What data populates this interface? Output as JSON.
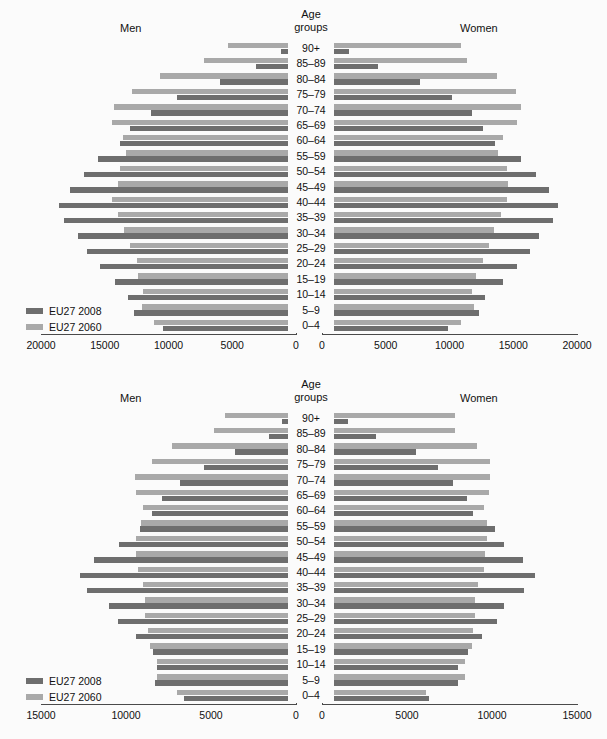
{
  "headers": {
    "men": "Men",
    "women": "Women",
    "age_line1": "Age",
    "age_line2": "groups"
  },
  "legend": {
    "series1": "EU27 2008",
    "series2": "EU27 2060",
    "color1": "#6e6e6e",
    "color2": "#a9a9a9"
  },
  "chart_data": [
    {
      "type": "bar",
      "title": "EU27 population pyramid 2008 vs 2060 (absolute, thousands)",
      "orientation": "horizontal-diverging",
      "xlabel": "",
      "ylabel": "Age groups",
      "xlim": [
        -20000,
        20000
      ],
      "grid": false,
      "legend_position": "bottom-left",
      "left_label": "Men",
      "right_label": "Women",
      "xticks_left": [
        "20000",
        "15000",
        "10000",
        "5000",
        "0"
      ],
      "xticks_right": [
        "0",
        "5000",
        "10000",
        "15000",
        "20000"
      ],
      "xtick_values_left": [
        20000,
        15000,
        10000,
        5000,
        0
      ],
      "xtick_values_right": [
        0,
        5000,
        10000,
        15000,
        20000
      ],
      "categories": [
        "90+",
        "85–89",
        "80–84",
        "75–79",
        "70–74",
        "65–69",
        "60–64",
        "55–59",
        "50–54",
        "45–49",
        "40–44",
        "35–39",
        "30–34",
        "25–29",
        "20–24",
        "15–19",
        "10–14",
        "5–9",
        "0–4"
      ],
      "series": [
        {
          "name": "EU27 2008",
          "side": "men",
          "values": [
            1200,
            3100,
            6000,
            9300,
            11400,
            13000,
            13800,
            15500,
            16600,
            17700,
            18600,
            18200,
            17100,
            16400,
            15400,
            14200,
            13200,
            12700,
            10400
          ]
        },
        {
          "name": "EU27 2060",
          "side": "men",
          "values": [
            5300,
            7200,
            10700,
            12900,
            14300,
            14400,
            13600,
            13300,
            13800,
            14000,
            14400,
            14000,
            13500,
            13000,
            12500,
            12400,
            12000,
            12100,
            11100
          ]
        },
        {
          "name": "EU27 2008",
          "side": "women",
          "values": [
            2100,
            4400,
            7700,
            10200,
            11800,
            12600,
            13600,
            15600,
            16800,
            17800,
            18500,
            18100,
            17000,
            16300,
            15300,
            14200,
            12800,
            12300,
            9900
          ]
        },
        {
          "name": "EU27 2060",
          "side": "women",
          "values": [
            10900,
            11400,
            13700,
            15200,
            15600,
            15300,
            14200,
            13800,
            14500,
            14600,
            14500,
            14000,
            13500,
            13100,
            12600,
            12100,
            11800,
            11900,
            10900
          ]
        }
      ]
    },
    {
      "type": "bar",
      "title": "EU27 population pyramid 2008 vs 2060 (alternative scenario, thousands)",
      "orientation": "horizontal-diverging",
      "xlabel": "",
      "ylabel": "Age groups",
      "xlim": [
        -15000,
        15000
      ],
      "grid": false,
      "legend_position": "bottom-left",
      "left_label": "Men",
      "right_label": "Women",
      "xticks_left": [
        "15000",
        "10000",
        "5000",
        "0"
      ],
      "xticks_right": [
        "0",
        "5000",
        "10000",
        "15000"
      ],
      "xtick_values_left": [
        15000,
        10000,
        5000,
        0
      ],
      "xtick_values_right": [
        0,
        5000,
        10000,
        15000
      ],
      "categories": [
        "90+",
        "85–89",
        "80–84",
        "75–79",
        "70–74",
        "65–69",
        "60–64",
        "55–59",
        "50–54",
        "45–49",
        "40–44",
        "35–39",
        "30–34",
        "25–29",
        "20–24",
        "15–19",
        "10–14",
        "5–9",
        "0–4"
      ],
      "series": [
        {
          "name": "EU27 2008",
          "side": "men",
          "values": [
            800,
            1600,
            3600,
            5400,
            6800,
            7900,
            8500,
            9200,
            10400,
            11900,
            12700,
            12300,
            11000,
            10500,
            9400,
            8400,
            8200,
            8300,
            6600
          ]
        },
        {
          "name": "EU27 2060",
          "side": "men",
          "values": [
            4200,
            4800,
            7300,
            8500,
            9500,
            9400,
            9000,
            9100,
            9400,
            9400,
            9300,
            9000,
            8900,
            8900,
            8700,
            8600,
            8200,
            8200,
            7000
          ]
        },
        {
          "name": "EU27 2008",
          "side": "women",
          "values": [
            1500,
            3200,
            5500,
            6800,
            7700,
            8500,
            8900,
            10200,
            10700,
            11800,
            12500,
            11900,
            10700,
            10300,
            9400,
            8600,
            8000,
            8000,
            6300
          ]
        },
        {
          "name": "EU27 2060",
          "side": "women",
          "values": [
            7800,
            7800,
            9100,
            9900,
            9900,
            9800,
            9500,
            9700,
            9700,
            9600,
            9500,
            9200,
            9000,
            9000,
            8900,
            8800,
            8400,
            8400,
            6100
          ]
        }
      ]
    }
  ]
}
